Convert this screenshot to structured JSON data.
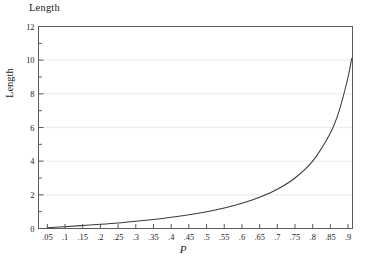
{
  "figure": {
    "title": "Length",
    "background_color": "#ffffff",
    "frame_color": "#5a5a5a",
    "grid_color": "#ededed",
    "curve_color": "#3a3a3a"
  },
  "chart_data": {
    "type": "line",
    "title": "Length",
    "xlabel": "P",
    "ylabel": "Length",
    "xlim": [
      0.025,
      0.9125
    ],
    "ylim": [
      0,
      12
    ],
    "grid": true,
    "legend": false,
    "x_tick_labels": [
      ".05",
      ".1",
      ".15",
      ".2",
      ".25",
      ".3",
      ".35",
      ".4",
      ".45",
      ".5",
      ".55",
      ".6",
      ".65",
      ".7",
      ".75",
      ".8",
      ".85",
      ".9"
    ],
    "x_tick_values": [
      0.05,
      0.1,
      0.15,
      0.2,
      0.25,
      0.3,
      0.35,
      0.4,
      0.45,
      0.5,
      0.55,
      0.6,
      0.65,
      0.7,
      0.75,
      0.8,
      0.85,
      0.9
    ],
    "y_tick_labels": [
      "0",
      "2",
      "4",
      "6",
      "8",
      "10",
      "12"
    ],
    "y_tick_values": [
      0,
      2,
      4,
      6,
      8,
      10,
      12
    ],
    "y_minor_ticks": [
      1,
      3,
      5,
      7,
      9,
      11
    ],
    "series": [
      {
        "name": "Length",
        "x": [
          0.05,
          0.1,
          0.15,
          0.2,
          0.25,
          0.3,
          0.35,
          0.4,
          0.45,
          0.5,
          0.55,
          0.6,
          0.65,
          0.7,
          0.75,
          0.8,
          0.85,
          0.875,
          0.9,
          0.91
        ],
        "values": [
          0.05,
          0.11,
          0.18,
          0.25,
          0.33,
          0.43,
          0.54,
          0.67,
          0.82,
          1.0,
          1.22,
          1.5,
          1.86,
          2.33,
          3.0,
          4.0,
          5.67,
          7.0,
          9.0,
          10.1
        ]
      }
    ]
  }
}
